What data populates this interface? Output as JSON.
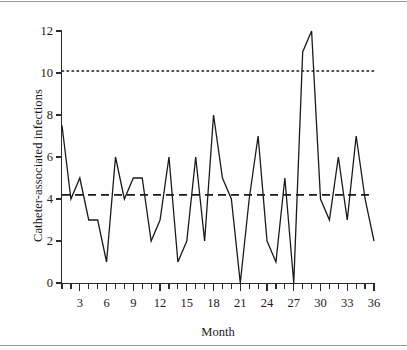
{
  "figure": {
    "kind": "run-chart",
    "ylabel": "Catheter-associated infections",
    "xlabel": "Month"
  },
  "axes": {
    "y_tick_labels": [
      "0",
      "2",
      "4",
      "6",
      "8",
      "10",
      "12"
    ],
    "x_tick_labels": [
      "3",
      "6",
      "9",
      "12",
      "15",
      "18",
      "21",
      "24",
      "27",
      "30",
      "33",
      "36"
    ],
    "y_min": 0,
    "y_max": 12,
    "x_min": 1,
    "x_max": 36
  },
  "colors": {
    "series_line": "#1a1a1a",
    "mean_line": "#1a1a1a",
    "limit_line": "#1a1a1a",
    "axis": "#2a2a2a",
    "rule": "#9a9a9a",
    "background": "#ffffff"
  },
  "chart_data": {
    "type": "line",
    "title": "",
    "xlabel": "Month",
    "ylabel": "Catheter-associated infections",
    "xlim": [
      1,
      36
    ],
    "ylim": [
      0,
      12
    ],
    "grid": false,
    "legend": "none",
    "x": [
      1,
      2,
      3,
      4,
      5,
      6,
      7,
      8,
      9,
      10,
      11,
      12,
      13,
      14,
      15,
      16,
      17,
      18,
      19,
      20,
      21,
      22,
      23,
      24,
      25,
      26,
      27,
      28,
      29,
      30,
      31,
      32,
      33,
      34,
      35,
      36
    ],
    "series": [
      {
        "name": "Catheter-associated infections",
        "style": "solid",
        "values": [
          7.5,
          4,
          5,
          3,
          3,
          1,
          6,
          4,
          5,
          5,
          2,
          3,
          6,
          1,
          2,
          6,
          2,
          8,
          5,
          4,
          0,
          4,
          7,
          2,
          1,
          5,
          0,
          11,
          12,
          4,
          3,
          6,
          3,
          7,
          4,
          2
        ]
      }
    ],
    "reference_lines": [
      {
        "name": "upper-limit",
        "style": "dotted",
        "value": 10.1
      },
      {
        "name": "mean",
        "style": "dashed",
        "value": 4.2
      }
    ]
  }
}
